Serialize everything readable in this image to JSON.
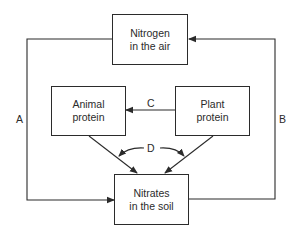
{
  "diagram": {
    "nodes": {
      "air": {
        "line1": "Nitrogen",
        "line2": "in the air"
      },
      "animal": {
        "line1": "Animal",
        "line2": "protein"
      },
      "plant": {
        "line1": "Plant",
        "line2": "protein"
      },
      "soil": {
        "line1": "Nitrates",
        "line2": "in the soil"
      }
    },
    "edges": [
      {
        "id": "A",
        "from": "air",
        "to": "soil",
        "label": "A"
      },
      {
        "id": "B",
        "from": "soil",
        "to": "air",
        "label": "B"
      },
      {
        "id": "C",
        "from": "plant",
        "to": "animal",
        "label": "C"
      },
      {
        "id": "D",
        "from": "animal+plant",
        "to": "soil",
        "label": "D"
      }
    ],
    "labels": {
      "a": "A",
      "b": "B",
      "c": "C",
      "d": "D"
    },
    "colors": {
      "stroke": "#2b2b2b",
      "background": "#ffffff"
    }
  }
}
